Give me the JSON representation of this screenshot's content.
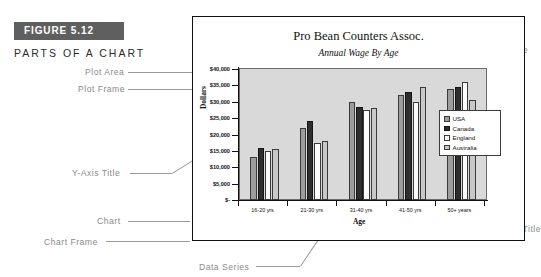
{
  "figure": {
    "badge_label": "FIGURE 5.12",
    "subhead": "PARTS OF A CHART"
  },
  "annotations": {
    "plot_area": "Plot Area",
    "plot_frame": "Plot Frame",
    "y_axis_title": "Y-Axis Title",
    "chart": "Chart",
    "chart_frame": "Chart Frame",
    "data_series": "Data Series",
    "y_axis": "Y-Axis",
    "title": "Title",
    "sub_title": "Sub-title",
    "legend": "Legend",
    "x_axis": "X-Axis",
    "x_axis_title": "X-Axis Title"
  },
  "chart_data": {
    "type": "bar",
    "title": "Pro Bean Counters Assoc.",
    "subtitle": "Annual Wage By Age",
    "xlabel": "Age",
    "ylabel": "Dollars",
    "ylim": [
      0,
      40000
    ],
    "grid": false,
    "legend_position": "inside-right",
    "categories": [
      "16-20 yrs",
      "21-30 yrs",
      "31-40 yrs",
      "41-50 yrs",
      "50+ years"
    ],
    "ytick_labels": [
      "$40,000",
      "$35,000",
      "$30,000",
      "$25,000",
      "$20,000",
      "$15,000",
      "$10,000",
      "$5,000",
      "$-"
    ],
    "ytick_values": [
      40000,
      35000,
      30000,
      25000,
      20000,
      15000,
      10000,
      5000,
      0
    ],
    "series": [
      {
        "name": "USA",
        "color": "#9d9d9d",
        "values": [
          13000,
          22000,
          30000,
          32000,
          34000
        ]
      },
      {
        "name": "Canada",
        "color": "#2e2e2e",
        "values": [
          16000,
          24000,
          28500,
          33000,
          34500
        ]
      },
      {
        "name": "England",
        "color": "#fbfbfb",
        "values": [
          15000,
          17500,
          27500,
          30000,
          36000
        ]
      },
      {
        "name": "Australia",
        "color": "#c8c8c8",
        "values": [
          15500,
          18000,
          28000,
          34500,
          30500
        ]
      }
    ]
  }
}
